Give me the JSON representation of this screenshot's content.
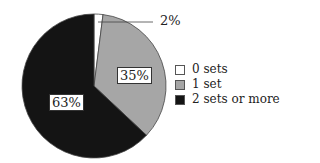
{
  "chart_data": {
    "type": "pie",
    "title": "",
    "categories": [
      "0 sets",
      "1 set",
      "2 sets or more"
    ],
    "values": [
      2,
      35,
      63
    ],
    "labels": [
      "2%",
      "35%",
      "63%"
    ],
    "colors": [
      "#ffffff",
      "#a6a6a6",
      "#141414"
    ],
    "legend_position": "right"
  },
  "legend": [
    {
      "label": "0 sets",
      "color": "#ffffff"
    },
    {
      "label": "1 set",
      "color": "#a6a6a6"
    },
    {
      "label": "2 sets or more",
      "color": "#141414"
    }
  ]
}
